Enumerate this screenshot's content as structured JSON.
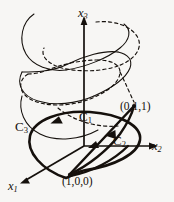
{
  "figure": {
    "kind": "3d-coordinate-diagram",
    "background_color": "#f7f6f4",
    "ink_color": "#15100c",
    "width": 174,
    "height": 202
  },
  "axes": [
    {
      "id": "x3",
      "label": "x",
      "sub": "3",
      "direction": "up",
      "desc": "vertical axis with arrowhead pointing up"
    },
    {
      "id": "x2",
      "label": "x",
      "sub": "2",
      "direction": "right",
      "desc": "horizontal axis with arrowhead pointing right"
    },
    {
      "id": "x1",
      "label": "x",
      "sub": "1",
      "direction": "down-left",
      "desc": "oblique axis with arrowhead pointing down-left"
    }
  ],
  "curves": [
    {
      "id": "C1",
      "label": "C",
      "sub": "1",
      "style": "solid-bold",
      "desc": "straight chord / arc from (1,0,0) up to (0,1,1)"
    },
    {
      "id": "C2",
      "label": "C",
      "sub": "2",
      "style": "solid-bold",
      "desc": "lower arc from (1,0,0) through the x1-x2 plane up to (0,1,1)"
    },
    {
      "id": "C3",
      "label": "C",
      "sub": "3",
      "style": "solid-bold",
      "desc": "large tilted ellipse through (1,0,0) and (0,1,1)"
    }
  ],
  "points": [
    {
      "id": "p011",
      "label": "(0,1,1)",
      "desc": "upper right endpoint on the tilted ellipse"
    },
    {
      "id": "p100",
      "label": "(1,0,0)",
      "desc": "lower left endpoint on the x1 axis"
    }
  ],
  "helices": [
    {
      "id": "helix-solid",
      "style": "solid",
      "desc": "thin solid helix winding up around the x3 axis"
    },
    {
      "id": "helix-dashed",
      "style": "dashed",
      "desc": "thin dashed helix winding up around the x3 axis, offset in phase"
    }
  ]
}
